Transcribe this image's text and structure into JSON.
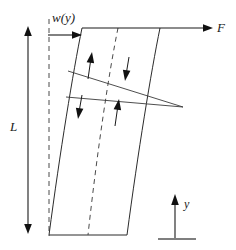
{
  "figure": {
    "kind": "engineering-diagram",
    "background_color": "#ffffff",
    "line_color": "#2b2b2b",
    "dash_color": "#4a4a4a",
    "arrow_color": "#111111"
  },
  "labels": {
    "distributed_load": "w(y)",
    "tip_force": "F",
    "length": "L",
    "axis_y": "y"
  },
  "annotations": {
    "load_arrow_name": "distributed-load-arrow",
    "force_arrow_name": "tip-force-arrow",
    "length_arrow_name": "length-dimension-arrow",
    "axis_arrow_name": "y-axis-arrow"
  },
  "geometry": {
    "left_edge": "M82,28 C70,80 58,150 49,235",
    "mid_dashed_curve": "M118,28 C107,80 96,150 88,235",
    "right_edge": "M160,28 C148,80 136,150 127,235",
    "reference_dashed_line": "M49,20 L49,235",
    "top_edge": "M82,28 L212,28",
    "bottom_edge": "M49,235 L127,235",
    "section_line_upper": "M70,71 L183,107",
    "section_line_lower": "M68,97 L183,107",
    "length_arrow": "M28,28 L28,232",
    "axis_arrow": "M175,238 L175,196",
    "axis_base": "M158,239 L196,239",
    "load_arrow": "M48,35 L80,35",
    "force_arrow": "M84,28 L210,28"
  },
  "interior_arrows": [
    {
      "name": "stress-arrow-up-left",
      "direction": "up",
      "tail": "88,79",
      "tip": "91,54"
    },
    {
      "name": "stress-arrow-down-right",
      "direction": "down",
      "tail": "129,57",
      "tip": "126,80"
    },
    {
      "name": "stress-arrow-down-left",
      "direction": "down",
      "tail": "82,95",
      "tip": "79,118"
    },
    {
      "name": "stress-arrow-up-right",
      "direction": "up",
      "tail": "115,126",
      "tip": "118,101"
    }
  ],
  "label_positions": {
    "distributed_load": {
      "x": 52,
      "y": 22
    },
    "tip_force": {
      "x": 218,
      "y": 32
    },
    "length": {
      "x": 11,
      "y": 131
    },
    "axis_y": {
      "x": 184,
      "y": 208
    }
  }
}
